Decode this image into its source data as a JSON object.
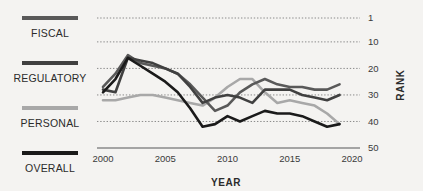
{
  "legend": {
    "items": [
      {
        "label": "FISCAL",
        "color": "#595959"
      },
      {
        "label": "REGULATORY",
        "color": "#404040"
      },
      {
        "label": "PERSONAL",
        "color": "#a8a8a8"
      },
      {
        "label": "OVERALL",
        "color": "#1a1a1a"
      }
    ]
  },
  "chart_data": {
    "type": "line",
    "title": "",
    "xlabel": "YEAR",
    "ylabel": "RANK",
    "xlim": [
      2000,
      2020
    ],
    "ylim": [
      1,
      50
    ],
    "y_inverted": true,
    "grid": true,
    "grid_style": "dotted-horizontal",
    "legend_position": "left",
    "xticks": [
      2000,
      2005,
      2010,
      2015,
      2020
    ],
    "xticklabels": [
      "2000",
      "2005",
      "2010",
      "2015",
      "2020"
    ],
    "yticks": [
      1,
      10,
      20,
      30,
      40,
      50
    ],
    "yticklabels": [
      "1",
      "10",
      "20",
      "30",
      "40",
      "50"
    ],
    "x": [
      2000,
      2001,
      2002,
      2003,
      2004,
      2005,
      2006,
      2007,
      2008,
      2009,
      2010,
      2011,
      2012,
      2013,
      2014,
      2015,
      2016,
      2017,
      2018,
      2019
    ],
    "series": [
      {
        "name": "FISCAL",
        "color": "#595959",
        "values": [
          27,
          22,
          15,
          18,
          19,
          20,
          22,
          26,
          31,
          36,
          34,
          29,
          26,
          24,
          26,
          27,
          27,
          28,
          28,
          26
        ]
      },
      {
        "name": "REGULATORY",
        "color": "#404040",
        "values": [
          28,
          29,
          16,
          17,
          18,
          20,
          22,
          27,
          33,
          31,
          30,
          31,
          33,
          28,
          28,
          28,
          30,
          31,
          32,
          30
        ]
      },
      {
        "name": "PERSONAL",
        "color": "#a8a8a8",
        "values": [
          32,
          32,
          31,
          30,
          30,
          31,
          32,
          33,
          34,
          31,
          27,
          24,
          24,
          29,
          33,
          32,
          33,
          34,
          37,
          41
        ]
      },
      {
        "name": "OVERALL",
        "color": "#1a1a1a",
        "values": [
          29,
          24,
          16,
          19,
          22,
          25,
          29,
          35,
          42,
          41,
          38,
          40,
          38,
          36,
          37,
          37,
          38,
          40,
          42,
          41
        ]
      }
    ]
  }
}
